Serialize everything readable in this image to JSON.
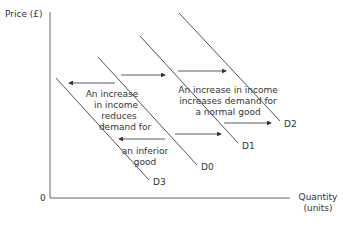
{
  "chart_data": {
    "type": "diagram",
    "title": "",
    "ylabel": "Price (£)",
    "xlabel_line1": "Quantity",
    "xlabel_line2": "(units)",
    "origin": "0",
    "curves": [
      {
        "name": "D3",
        "x1": 56,
        "y1": 78,
        "x2": 149,
        "y2": 180
      },
      {
        "name": "D0",
        "x1": 98,
        "y1": 57,
        "x2": 197,
        "y2": 165
      },
      {
        "name": "D1",
        "x1": 140,
        "y1": 36,
        "x2": 238,
        "y2": 143
      },
      {
        "name": "D2",
        "x1": 179,
        "y1": 13,
        "x2": 280,
        "y2": 121
      }
    ],
    "annotations": {
      "normal_good": [
        "An increase in income",
        "increases demand for",
        "a normal good"
      ],
      "inferior_good_top": [
        "An increase",
        "in income",
        "reduces",
        "demand for"
      ],
      "inferior_good_bottom": [
        "an inferior",
        "good"
      ]
    },
    "arrows": [
      {
        "direction": "left",
        "x1": 115,
        "x2": 69,
        "y": 83
      },
      {
        "direction": "right",
        "x1": 121,
        "x2": 165,
        "y": 75
      },
      {
        "direction": "right",
        "x1": 178,
        "x2": 226,
        "y": 71
      },
      {
        "direction": "left",
        "x1": 165,
        "x2": 119,
        "y": 139
      },
      {
        "direction": "right",
        "x1": 175,
        "x2": 221,
        "y": 134
      },
      {
        "direction": "right",
        "x1": 224,
        "x2": 271,
        "y": 123
      }
    ]
  }
}
